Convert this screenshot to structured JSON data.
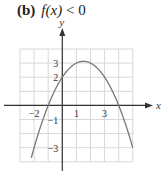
{
  "header": {
    "label": "(b)",
    "condition_fn": "f(x)",
    "condition_rest": " < 0"
  },
  "chart_data": {
    "type": "line",
    "xlabel": "x",
    "ylabel": "y",
    "xlim": [
      -3,
      5
    ],
    "ylim": [
      -4,
      4
    ],
    "grid": true,
    "x_tick_labels": [
      "-2",
      "1",
      "3"
    ],
    "y_tick_labels": [
      "3",
      "2",
      "-1",
      "-3"
    ],
    "series": [
      {
        "name": "f(x) = -0.5x^2 + 1.5x + 2",
        "x": [
          -2.2,
          -2,
          -1.5,
          -1,
          -0.5,
          0,
          0.5,
          1,
          1.5,
          2,
          2.5,
          3,
          3.5,
          4,
          4.5,
          5
        ],
        "values": [
          -3.72,
          -3,
          -1.38,
          0,
          1.13,
          2,
          2.63,
          3,
          3.125,
          3,
          2.63,
          2,
          1.13,
          0,
          -1.38,
          -3
        ]
      }
    ],
    "colors": {
      "curve": "#777777",
      "grid": "#d8d8d8",
      "axis": "#333333"
    }
  }
}
